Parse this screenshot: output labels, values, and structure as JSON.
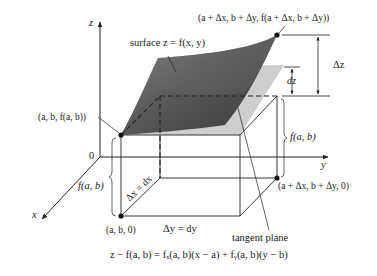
{
  "figure": {
    "type": "3d-diagram"
  },
  "axes": {
    "z_label": "z",
    "y_label": "y",
    "x_label": "x",
    "origin_label": "0"
  },
  "labels": {
    "surface": "surface z = f(x, y)",
    "point_top": "(a + Δx, b + Δy, f(a + Δx, b + Δy))",
    "point_base": "(a, b, f(a, b))",
    "delta_z": "Δz",
    "dz": "dz",
    "fab_right": "f(a, b)",
    "fab_left": "f(a, b)",
    "point_far_ground": "(a + Δx, b + Δy, 0)",
    "point_ground": "(a, b, 0)",
    "delta_x": "Δx = dx",
    "delta_y": "Δy = dy",
    "tangent_plane": "tangent plane",
    "equation": "z − f(a, b) = fₓ(a, b)(x − a) + fᵧ(a, b)(y − b)"
  },
  "colors": {
    "surface_dark": "#4a4a4a",
    "surface_light": "#9a9a9a",
    "tangent_plane": "#c8c8c8",
    "line": "#222222"
  }
}
